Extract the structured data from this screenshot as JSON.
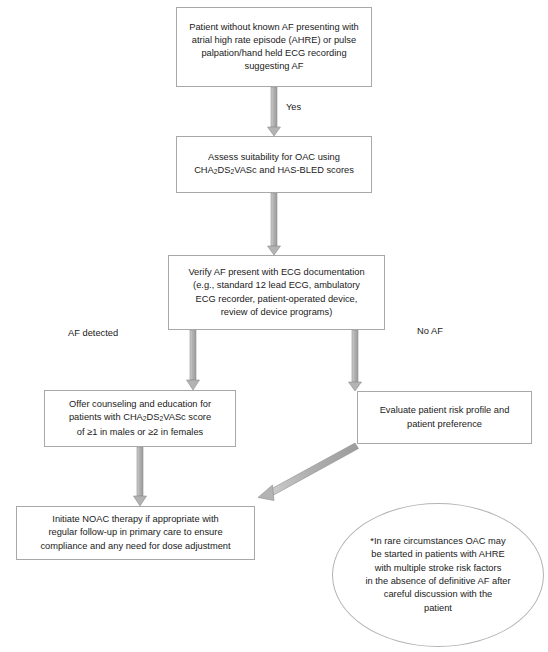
{
  "diagram": {
    "colors": {
      "arrow_fill": "#b3b3b3",
      "arrow_stroke": "#8c8c8c",
      "box_border": "#a8a8a8",
      "text": "#1a1a1a",
      "background": "#ffffff"
    },
    "nodes": [
      {
        "id": "start",
        "shape": "rect",
        "text": "Patient without known AF presenting with atrial high rate episode (AHRE) or pulse palpation/hand held ECG recording suggesting AF",
        "lines": [
          "Patient without known AF presenting with",
          "atrial high rate episode (AHRE) or pulse",
          "palpation/hand held ECG recording",
          "suggesting AF"
        ]
      },
      {
        "id": "assess",
        "shape": "rect",
        "text": "Assess suitability for OAC using CHA2DS2VASc and HAS-BLED scores",
        "lines": [
          "Assess suitability for OAC using",
          "CHA<sub>2</sub>DS<sub>2</sub>VASc and HAS-BLED scores"
        ]
      },
      {
        "id": "verify",
        "shape": "rect",
        "text": "Verify AF present with ECG documentation (e.g., standard 12 lead ECG, ambulatory ECG recorder, patient-operated device, review of device programs)",
        "lines": [
          "Verify AF present with ECG documentation",
          "(e.g., standard 12 lead ECG, ambulatory",
          "ECG recorder, patient-operated device,",
          "review of device programs)"
        ]
      },
      {
        "id": "counseling",
        "shape": "rect",
        "text": "Offer counseling and education for patients with CHA2DS2VASc score of ≥1 in males or ≥2 in females",
        "lines": [
          "Offer counseling and education for",
          "patients with CHA<sub>2</sub>DS<sub>2</sub>VASc score",
          "of ≥1 in males or ≥2 in females"
        ]
      },
      {
        "id": "evaluate",
        "shape": "rect",
        "text": "Evaluate patient risk profile and patient preference",
        "lines": [
          "Evaluate patient risk profile and",
          "patient preference"
        ]
      },
      {
        "id": "initiate",
        "shape": "rect",
        "text": "Initiate NOAC therapy if appropriate with regular follow-up in primary care to ensure compliance and any need for dose adjustment",
        "lines": [
          "Initiate NOAC therapy if appropriate with",
          "regular follow-up in primary care to ensure",
          "compliance and any need for dose adjustment"
        ]
      },
      {
        "id": "footnote",
        "shape": "ellipse",
        "text": "*In rare circumstances OAC may be started in patients with AHRE with multiple stroke risk factors in the absence of definitive AF after careful discussion with the patient",
        "lines": [
          "*In rare circumstances OAC may",
          "be started in patients with AHRE",
          "with multiple stroke risk factors",
          "in the absence of definitive AF after",
          "careful discussion with the",
          "patient"
        ]
      }
    ],
    "edge_labels": {
      "yes": "Yes",
      "af_detected": "AF detected",
      "no_af": "No AF"
    }
  }
}
